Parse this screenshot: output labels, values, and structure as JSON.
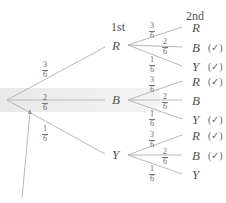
{
  "headers": {
    "first": "1st",
    "second": "2nd"
  },
  "root": {
    "label": ""
  },
  "first_level": [
    {
      "node": "R",
      "prob": {
        "num": "3",
        "den": "6"
      }
    },
    {
      "node": "B",
      "prob": {
        "num": "2",
        "den": "6"
      }
    },
    {
      "node": "Y",
      "prob": {
        "num": "1",
        "den": "6"
      }
    }
  ],
  "second_level": {
    "R": [
      {
        "node": "R",
        "prob": {
          "num": "3",
          "den": "6"
        },
        "mark": ""
      },
      {
        "node": "B",
        "prob": {
          "num": "2",
          "den": "6"
        },
        "mark": "(✓)"
      },
      {
        "node": "Y",
        "prob": {
          "num": "1",
          "den": "6"
        },
        "mark": "(✓)"
      }
    ],
    "B": [
      {
        "node": "R",
        "prob": {
          "num": "3",
          "den": "6"
        },
        "mark": "(✓)"
      },
      {
        "node": "B",
        "prob": {
          "num": "2",
          "den": "6"
        },
        "mark": ""
      },
      {
        "node": "Y",
        "prob": {
          "num": "1",
          "den": "6"
        },
        "mark": "(✓)"
      }
    ],
    "Y": [
      {
        "node": "R",
        "prob": {
          "num": "3",
          "den": "6"
        },
        "mark": "(✓)"
      },
      {
        "node": "B",
        "prob": {
          "num": "2",
          "den": "6"
        },
        "mark": "(✓)"
      },
      {
        "node": "Y",
        "prob": {
          "num": "1",
          "den": "6"
        },
        "mark": ""
      }
    ]
  },
  "colors": {
    "line": "#b5b5b5",
    "highlight": "#e6e6e6",
    "text": "#555555"
  }
}
